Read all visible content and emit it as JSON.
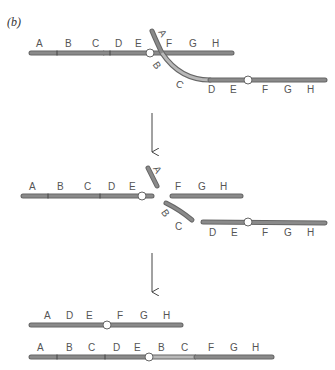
{
  "panel_label": "(b)",
  "colors": {
    "chromosome": "#7a7a7a",
    "chromosome_light": "#b8b8b8",
    "outline": "#555555",
    "centromere_fill": "#ffffff",
    "arrow": "#444444",
    "text": "#555555"
  },
  "stage1": {
    "description": "Paired chromosomes with inversion loop crossing over",
    "top_chromosome": {
      "labels": [
        "A",
        "B",
        "C",
        "D",
        "E",
        "F",
        "G",
        "H"
      ]
    },
    "crossing_strand": {
      "labels": [
        "A",
        "B",
        "C"
      ]
    },
    "bottom_chromosome": {
      "labels": [
        "D",
        "E",
        "F",
        "G",
        "H"
      ]
    }
  },
  "stage2": {
    "description": "Chromosomes broken at crossover point",
    "left_fragment": {
      "labels": [
        "A",
        "B",
        "C",
        "D",
        "E"
      ]
    },
    "a_fragment": {
      "labels": [
        "A"
      ]
    },
    "right_fragment_top": {
      "labels": [
        "F",
        "G",
        "H"
      ]
    },
    "bc_fragment": {
      "labels": [
        "B",
        "C"
      ]
    },
    "bottom_fragment": {
      "labels": [
        "D",
        "E",
        "F",
        "G",
        "H"
      ]
    }
  },
  "stage3": {
    "description": "Resulting recombinant chromosomes",
    "deletion_product": {
      "labels": [
        "A",
        "D",
        "E",
        "F",
        "G",
        "H"
      ]
    },
    "duplication_product": {
      "labels": [
        "A",
        "B",
        "C",
        "D",
        "E",
        "B",
        "C",
        "F",
        "G",
        "H"
      ]
    }
  }
}
